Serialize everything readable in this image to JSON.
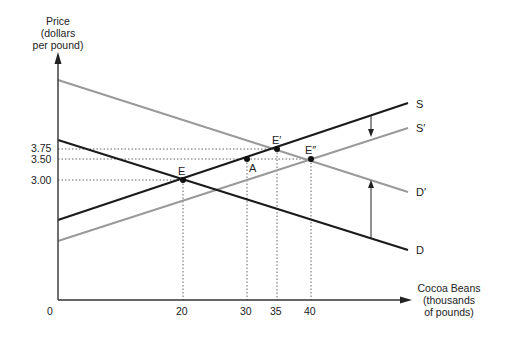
{
  "axes": {
    "y_label": [
      "Price",
      "(dollars",
      "per pound)"
    ],
    "x_label": [
      "Cocoa Beans",
      "(thousands",
      "of pounds)"
    ],
    "origin": "0",
    "y_ticks": [
      {
        "label": "3.75",
        "value": 3.75
      },
      {
        "label": "3.50",
        "value": 3.5
      },
      {
        "label": "3.00",
        "value": 3.0
      }
    ],
    "x_ticks": [
      {
        "label": "20",
        "value": 20
      },
      {
        "label": "30",
        "value": 30
      },
      {
        "label": "35",
        "value": 35
      },
      {
        "label": "40",
        "value": 40
      }
    ]
  },
  "curves": [
    {
      "id": "S",
      "label": "S",
      "color": "#1a1a1a",
      "type": "supply"
    },
    {
      "id": "S_prime",
      "label": "S′",
      "color": "#9a9a9a",
      "type": "supply"
    },
    {
      "id": "D",
      "label": "D",
      "color": "#1a1a1a",
      "type": "demand"
    },
    {
      "id": "D_prime",
      "label": "D′",
      "color": "#9a9a9a",
      "type": "demand"
    }
  ],
  "points": [
    {
      "label": "E",
      "quantity": 20,
      "price": 3.0
    },
    {
      "label": "A",
      "quantity": 30,
      "price": 3.5
    },
    {
      "label": "E′",
      "quantity": 35,
      "price": 3.75
    },
    {
      "label": "E″",
      "quantity": 40,
      "price": 3.5
    }
  ],
  "shifts": [
    {
      "from": "S",
      "to": "S′",
      "direction": "down"
    },
    {
      "from": "D",
      "to": "D′",
      "direction": "up"
    }
  ]
}
